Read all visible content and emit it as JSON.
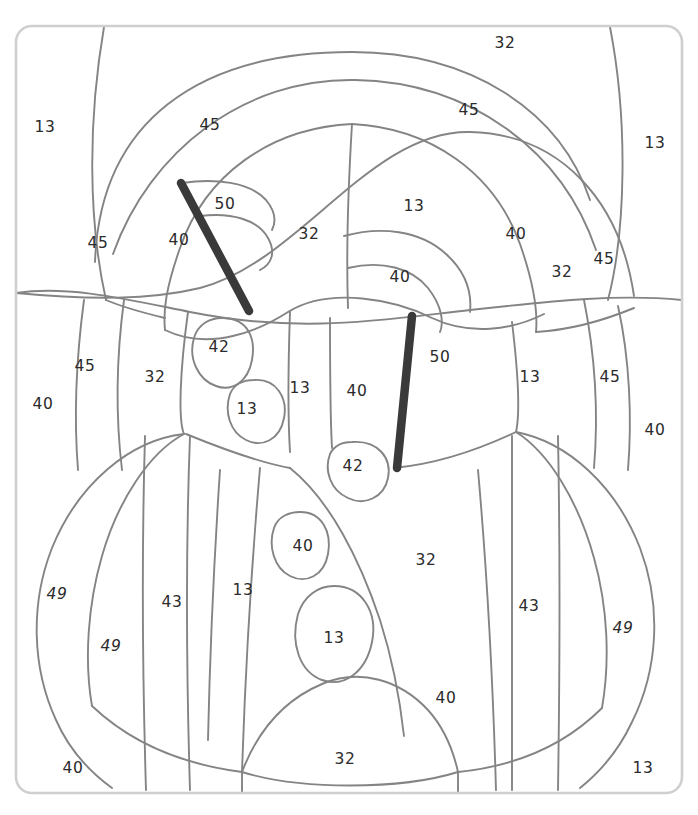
{
  "page": {
    "width": 698,
    "height": 815,
    "background": "#ffffff",
    "top_fragment_text": "",
    "frame": {
      "stroke": "#cfcfcf",
      "x": 16,
      "y": 26,
      "w": 666,
      "h": 767,
      "radius": 16
    },
    "line_color": "#848484",
    "bar_color": "#3a3a3a",
    "label_color": "#2b2b2b"
  },
  "diagram": {
    "type": "region-labeled line art",
    "label_values_used": [
      13,
      32,
      40,
      42,
      43,
      45,
      49,
      50
    ],
    "bars": [
      {
        "name": "bar-upper-left",
        "x1": 181,
        "y1": 183,
        "x2": 249,
        "y2": 311
      },
      {
        "name": "bar-lower-right",
        "x1": 412,
        "y1": 316,
        "x2": 397,
        "y2": 468
      }
    ],
    "labels": [
      {
        "id": "l01",
        "text": "32",
        "x": 505,
        "y": 43,
        "italic": false
      },
      {
        "id": "l02",
        "text": "45",
        "x": 469,
        "y": 110,
        "italic": false
      },
      {
        "id": "l03",
        "text": "13",
        "x": 45,
        "y": 127,
        "italic": false
      },
      {
        "id": "l04",
        "text": "45",
        "x": 210,
        "y": 125,
        "italic": false
      },
      {
        "id": "l05",
        "text": "13",
        "x": 655,
        "y": 143,
        "italic": false
      },
      {
        "id": "l06",
        "text": "50",
        "x": 225,
        "y": 204,
        "italic": false
      },
      {
        "id": "l07",
        "text": "13",
        "x": 414,
        "y": 206,
        "italic": false
      },
      {
        "id": "l08",
        "text": "40",
        "x": 516,
        "y": 234,
        "italic": false
      },
      {
        "id": "l09",
        "text": "32",
        "x": 309,
        "y": 234,
        "italic": false
      },
      {
        "id": "l10",
        "text": "40",
        "x": 179,
        "y": 240,
        "italic": false
      },
      {
        "id": "l11",
        "text": "45",
        "x": 98,
        "y": 243,
        "italic": false
      },
      {
        "id": "l12",
        "text": "40",
        "x": 400,
        "y": 277,
        "italic": false
      },
      {
        "id": "l13",
        "text": "32",
        "x": 562,
        "y": 272,
        "italic": false
      },
      {
        "id": "l14",
        "text": "45",
        "x": 604,
        "y": 259,
        "italic": false
      },
      {
        "id": "l15",
        "text": "42",
        "x": 219,
        "y": 347,
        "italic": false
      },
      {
        "id": "l16",
        "text": "45",
        "x": 85,
        "y": 366,
        "italic": false
      },
      {
        "id": "l17",
        "text": "32",
        "x": 155,
        "y": 377,
        "italic": false
      },
      {
        "id": "l18",
        "text": "13",
        "x": 300,
        "y": 388,
        "italic": false
      },
      {
        "id": "l19",
        "text": "40",
        "x": 357,
        "y": 391,
        "italic": false
      },
      {
        "id": "l20",
        "text": "50",
        "x": 440,
        "y": 357,
        "italic": false
      },
      {
        "id": "l21",
        "text": "13",
        "x": 530,
        "y": 377,
        "italic": false
      },
      {
        "id": "l22",
        "text": "45",
        "x": 610,
        "y": 377,
        "italic": false
      },
      {
        "id": "l23",
        "text": "40",
        "x": 43,
        "y": 404,
        "italic": false
      },
      {
        "id": "l24",
        "text": "13",
        "x": 247,
        "y": 409,
        "italic": false
      },
      {
        "id": "l25",
        "text": "40",
        "x": 655,
        "y": 430,
        "italic": false
      },
      {
        "id": "l26",
        "text": "42",
        "x": 353,
        "y": 466,
        "italic": false
      },
      {
        "id": "l27",
        "text": "40",
        "x": 303,
        "y": 546,
        "italic": false
      },
      {
        "id": "l28",
        "text": "32",
        "x": 426,
        "y": 560,
        "italic": false
      },
      {
        "id": "l29",
        "text": "49",
        "x": 57,
        "y": 594,
        "italic": true
      },
      {
        "id": "l30",
        "text": "43",
        "x": 172,
        "y": 602,
        "italic": false
      },
      {
        "id": "l31",
        "text": "13",
        "x": 243,
        "y": 590,
        "italic": false
      },
      {
        "id": "l32",
        "text": "43",
        "x": 529,
        "y": 606,
        "italic": false
      },
      {
        "id": "l33",
        "text": "49",
        "x": 623,
        "y": 628,
        "italic": true
      },
      {
        "id": "l34",
        "text": "49",
        "x": 111,
        "y": 646,
        "italic": true
      },
      {
        "id": "l35",
        "text": "13",
        "x": 334,
        "y": 638,
        "italic": false
      },
      {
        "id": "l36",
        "text": "40",
        "x": 446,
        "y": 698,
        "italic": false
      },
      {
        "id": "l37",
        "text": "40",
        "x": 73,
        "y": 768,
        "italic": false
      },
      {
        "id": "l38",
        "text": "32",
        "x": 345,
        "y": 759,
        "italic": false
      },
      {
        "id": "l39",
        "text": "13",
        "x": 643,
        "y": 768,
        "italic": false
      }
    ],
    "paths": [
      {
        "name": "arc-outer-top-left",
        "d": "M 104 27 C 88 120 88 220 106 300"
      },
      {
        "name": "arc-outer-top-right",
        "d": "M 610 27 C 628 120 626 230 608 300"
      },
      {
        "name": "arc-big-head-left",
        "d": "M 95 262 C 100 120 200 52 352 52 C 470 52 560 110 590 200"
      },
      {
        "name": "arc-head-inner",
        "d": "M 113 254 C 150 150 245 78 355 80 C 470 82 562 150 596 250"
      },
      {
        "name": "ellipse-wide-top",
        "d": "M 16 293 C 90 300 150 300 200 288 C 300 262 370 130 470 132 C 560 134 620 200 634 296"
      },
      {
        "name": "ellipse-wide-bottom",
        "d": "M 16 293 C 70 285 130 300 190 312 C 300 334 380 320 470 310 C 560 300 620 294 682 300"
      },
      {
        "name": "head-mid-left",
        "d": "M 352 124 C 270 128 205 175 180 248 C 166 288 163 310 165 330"
      },
      {
        "name": "head-mid-right",
        "d": "M 352 124 C 430 128 494 172 520 244 C 534 284 538 310 536 332"
      },
      {
        "name": "center-spine-upper",
        "d": "M 352 124 C 348 190 346 250 348 308"
      },
      {
        "name": "inner-left-loop",
        "d": "M 182 183 C 215 178 250 182 266 200 C 276 212 276 222 272 230"
      },
      {
        "name": "inner-left-loop2",
        "d": "M 200 216 C 232 212 258 220 268 238 C 276 252 272 264 260 270"
      },
      {
        "name": "inner-right-loop",
        "d": "M 344 236 C 380 226 420 230 446 254 C 466 272 472 292 470 312"
      },
      {
        "name": "inner-right-loop2",
        "d": "M 348 268 C 382 260 412 268 428 288 C 442 306 444 322 440 332"
      },
      {
        "name": "shoulder-left",
        "d": "M 106 300 C 120 306 140 312 165 318"
      },
      {
        "name": "shoulder-right",
        "d": "M 536 332 C 570 330 600 322 634 308"
      },
      {
        "name": "torso-top-curve",
        "d": "M 165 330 C 210 352 260 330 288 312 C 330 286 396 300 432 318 C 470 336 512 330 544 314"
      },
      {
        "name": "torso-left-edge",
        "d": "M 84 300 C 76 360 74 420 78 470"
      },
      {
        "name": "torso-left-edge2",
        "d": "M 124 300 C 116 360 116 420 122 470"
      },
      {
        "name": "torso-mid-left",
        "d": "M 188 312 C 180 370 178 420 184 434"
      },
      {
        "name": "torso-right-edge",
        "d": "M 584 300 C 596 360 598 420 594 468"
      },
      {
        "name": "torso-right-edge2",
        "d": "M 618 306 C 630 360 632 420 628 470"
      },
      {
        "name": "torso-mid-right",
        "d": "M 512 322 C 518 372 520 414 516 432"
      },
      {
        "name": "spine-lower-left",
        "d": "M 290 312 C 288 370 288 420 290 452"
      },
      {
        "name": "spine-lower-right",
        "d": "M 330 318 C 330 370 330 414 332 448"
      },
      {
        "name": "oval-42a",
        "d": "M 222 318 C 248 318 256 338 252 360 C 248 382 232 392 216 386 C 198 380 188 358 194 338 C 198 324 210 318 222 318 Z"
      },
      {
        "name": "oval-13a",
        "d": "M 254 380 C 276 378 288 398 284 418 C 280 440 262 448 246 440 C 230 432 224 412 230 394 C 234 384 244 380 254 380 Z"
      },
      {
        "name": "oval-42b",
        "d": "M 352 442 C 378 440 392 458 388 478 C 384 498 364 506 348 498 C 330 490 324 470 330 454 C 334 446 342 442 352 442 Z"
      },
      {
        "name": "oval-40b",
        "d": "M 300 512 C 322 512 332 532 328 554 C 324 576 306 584 290 576 C 274 568 268 546 274 528 C 278 516 290 512 300 512 Z"
      },
      {
        "name": "oval-13b",
        "d": "M 334 586 C 362 586 378 612 372 642 C 366 672 344 688 322 680 C 300 672 290 644 298 614 C 304 596 318 586 334 586 Z"
      },
      {
        "name": "belly-left-arc",
        "d": "M 184 434 C 130 440 78 484 52 548 C 30 604 32 668 56 720 C 70 752 90 772 112 788"
      },
      {
        "name": "belly-left-inner",
        "d": "M 184 434 C 150 452 118 500 102 556 C 88 604 84 660 92 706"
      },
      {
        "name": "belly-right-arc",
        "d": "M 516 432 C 568 442 616 486 640 548 C 662 606 658 670 632 722 C 618 752 600 772 580 788"
      },
      {
        "name": "belly-right-inner",
        "d": "M 516 432 C 548 452 578 500 594 558 C 608 608 610 662 602 708"
      },
      {
        "name": "belly-band-left",
        "d": "M 186 434 C 230 452 268 464 290 468"
      },
      {
        "name": "belly-band-right",
        "d": "M 516 432 C 474 452 436 464 394 468"
      },
      {
        "name": "leg-left-1",
        "d": "M 145 436 C 142 540 142 660 146 790"
      },
      {
        "name": "leg-left-2",
        "d": "M 190 436 C 186 540 186 660 190 790"
      },
      {
        "name": "leg-left-3",
        "d": "M 220 470 C 214 560 210 650 208 740"
      },
      {
        "name": "leg-left-4",
        "d": "M 260 468 C 252 560 246 650 242 772"
      },
      {
        "name": "leg-right-1",
        "d": "M 478 470 C 486 560 492 650 496 790"
      },
      {
        "name": "leg-right-2",
        "d": "M 512 436 C 512 540 512 660 512 790"
      },
      {
        "name": "leg-right-3",
        "d": "M 558 436 C 560 540 560 660 558 790"
      },
      {
        "name": "belly-inner-curve",
        "d": "M 290 468 C 330 500 360 560 380 620 C 394 664 400 700 404 736"
      },
      {
        "name": "bottom-round-left",
        "d": "M 92 706 C 130 742 180 764 242 772"
      },
      {
        "name": "bottom-round-right",
        "d": "M 602 708 C 566 744 518 766 458 772"
      },
      {
        "name": "bottom-cup",
        "d": "M 242 772 C 258 730 284 700 322 684 C 360 668 400 680 428 710 C 446 730 454 754 458 772"
      },
      {
        "name": "bottom-center-band",
        "d": "M 242 772 C 300 790 400 790 458 772"
      },
      {
        "name": "foot-line-left",
        "d": "M 242 772 C 242 782 242 788 242 793"
      },
      {
        "name": "foot-line-right",
        "d": "M 458 772 C 458 782 458 788 458 793"
      }
    ]
  }
}
